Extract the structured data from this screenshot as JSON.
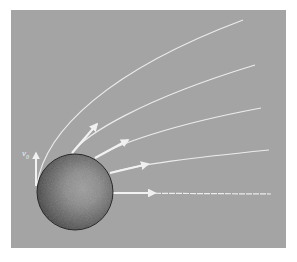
{
  "diagram": {
    "background_color": "#a4a4a4",
    "line_color": "#f0f0f0",
    "sphere": {
      "label": "planet",
      "dark_color": "#3a3a3a",
      "light_color": "#9a9a9a"
    },
    "velocity_label": {
      "symbol": "v",
      "subscript": "0"
    },
    "trajectories": [
      {
        "name": "trajectory-1",
        "type": "curve",
        "has_arrow": false
      },
      {
        "name": "trajectory-2",
        "type": "curve",
        "has_arrow": true
      },
      {
        "name": "trajectory-3",
        "type": "curve",
        "has_arrow": true
      },
      {
        "name": "trajectory-4",
        "type": "curve",
        "has_arrow": true
      },
      {
        "name": "trajectory-5",
        "type": "straight",
        "has_arrow": true
      }
    ]
  }
}
